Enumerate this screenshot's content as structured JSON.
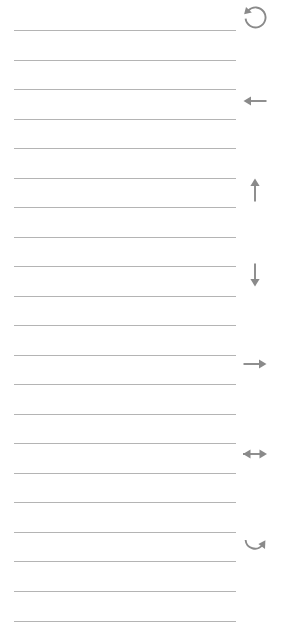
{
  "page": {
    "background_color": "#ffffff",
    "width": 286,
    "height": 642
  },
  "rules": {
    "color": "#b4b4b4",
    "thickness": 1,
    "left": 14,
    "right": 236,
    "first_y": 30,
    "spacing": 29.6,
    "count": 21,
    "y_positions": [
      30,
      60,
      89,
      119,
      148,
      178,
      207,
      237,
      266,
      296,
      325,
      355,
      384,
      414,
      443,
      473,
      502,
      532,
      561,
      591,
      621
    ]
  },
  "icons": {
    "color": "#8a8a8a",
    "column_x": 240,
    "items": [
      {
        "name": "rotate-counterclockwise-icon",
        "label": "Rotate counter-clockwise",
        "glyph": "↺",
        "x": 238,
        "y": 1
      },
      {
        "name": "arrow-left-icon",
        "label": "Move left",
        "glyph": "←",
        "x": 238,
        "y": 84
      },
      {
        "name": "arrow-up-icon",
        "label": "Move up",
        "glyph": "↑",
        "x": 238,
        "y": 173
      },
      {
        "name": "arrow-down-icon",
        "label": "Move down",
        "glyph": "↓",
        "x": 238,
        "y": 258
      },
      {
        "name": "arrow-right-icon",
        "label": "Move right",
        "glyph": "→",
        "x": 238,
        "y": 347
      },
      {
        "name": "arrow-left-right-icon",
        "label": "Move horizontally",
        "glyph": "↔",
        "x": 238,
        "y": 437
      },
      {
        "name": "rotate-clockwise-icon",
        "label": "Rotate clockwise",
        "glyph": "↻",
        "x": 238,
        "y": 528
      }
    ]
  }
}
